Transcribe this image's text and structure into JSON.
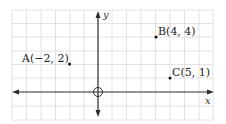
{
  "diagram": {
    "type": "coordinate-plane",
    "axes": {
      "x_label": "x",
      "y_label": "y"
    },
    "grid": {
      "x_min": -6,
      "x_max": 8,
      "y_min": -2,
      "y_max": 6,
      "on": true
    },
    "points": [
      {
        "name": "A",
        "x": -2,
        "y": 2,
        "label": "A(−2, 2)"
      },
      {
        "name": "B",
        "x": 4,
        "y": 4,
        "label": "B(4, 4)"
      },
      {
        "name": "C",
        "x": 5,
        "y": 1,
        "label": "C(5, 1)"
      }
    ],
    "colors": {
      "grid": "#e2e2e2",
      "axis": "#2a2a2a",
      "point": "#111111"
    }
  }
}
